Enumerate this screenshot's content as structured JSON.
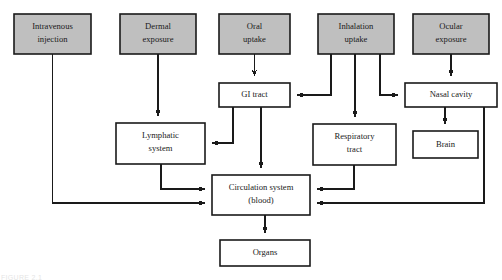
{
  "figure": {
    "caption_fragment": "FIGURE 2.1",
    "colors": {
      "source_box_fill": "#bfbfbf",
      "target_box_fill": "#ffffff",
      "stroke": "#1a1a1a",
      "background": "#ffffff"
    }
  },
  "nodes": {
    "intravenous_injection": {
      "label_line1": "Intravenous",
      "label_line2": "injection",
      "type": "exposure-route",
      "fill": "#bfbfbf",
      "x": 14,
      "y": 14,
      "w": 77,
      "h": 40
    },
    "dermal_exposure": {
      "label_line1": "Dermal",
      "label_line2": "exposure",
      "type": "exposure-route",
      "fill": "#bfbfbf",
      "x": 120,
      "y": 14,
      "w": 76,
      "h": 40
    },
    "oral_uptake": {
      "label_line1": "Oral",
      "label_line2": "uptake",
      "type": "exposure-route",
      "fill": "#bfbfbf",
      "x": 219,
      "y": 14,
      "w": 71,
      "h": 40
    },
    "inhalation_uptake": {
      "label_line1": "Inhalation",
      "label_line2": "uptake",
      "type": "exposure-route",
      "fill": "#bfbfbf",
      "x": 318,
      "y": 14,
      "w": 76,
      "h": 40
    },
    "ocular_exposure": {
      "label_line1": "Ocular",
      "label_line2": "exposure",
      "type": "exposure-route",
      "fill": "#bfbfbf",
      "x": 413,
      "y": 14,
      "w": 76,
      "h": 40
    },
    "gi_tract": {
      "label_line1": "GI tract",
      "label_line2": "",
      "type": "organ-system",
      "fill": "#ffffff",
      "x": 219,
      "y": 83,
      "w": 71,
      "h": 24
    },
    "nasal_cavity": {
      "label_line1": "Nasal cavity",
      "label_line2": "",
      "type": "organ-system",
      "fill": "#ffffff",
      "x": 405,
      "y": 83,
      "w": 92,
      "h": 24
    },
    "lymphatic_system": {
      "label_line1": "Lymphatic",
      "label_line2": "system",
      "type": "organ-system",
      "fill": "#ffffff",
      "x": 116,
      "y": 123,
      "w": 89,
      "h": 41
    },
    "respiratory_tract": {
      "label_line1": "Respiratory",
      "label_line2": "tract",
      "type": "organ-system",
      "fill": "#ffffff",
      "x": 313,
      "y": 124,
      "w": 83,
      "h": 41
    },
    "brain": {
      "label_line1": "Brain",
      "label_line2": "",
      "type": "organ-system",
      "fill": "#ffffff",
      "x": 413,
      "y": 131,
      "w": 65,
      "h": 27
    },
    "circulation_system": {
      "label_line1": "Circulation system",
      "label_line2": "(blood)",
      "type": "organ-system",
      "fill": "#ffffff",
      "x": 212,
      "y": 175,
      "w": 98,
      "h": 40
    },
    "organs": {
      "label_line1": "Organs",
      "label_line2": "",
      "type": "organ-system",
      "fill": "#ffffff",
      "x": 220,
      "y": 240,
      "w": 90,
      "h": 26
    }
  },
  "edges": [
    {
      "from": "intravenous_injection",
      "to": "circulation_system",
      "style": "orthogonal-left"
    },
    {
      "from": "dermal_exposure",
      "to": "lymphatic_system",
      "style": "straight-down"
    },
    {
      "from": "oral_uptake",
      "to": "gi_tract",
      "style": "straight-down"
    },
    {
      "from": "inhalation_uptake",
      "to": "gi_tract",
      "style": "orthogonal-left"
    },
    {
      "from": "inhalation_uptake",
      "to": "respiratory_tract",
      "style": "straight-down"
    },
    {
      "from": "inhalation_uptake",
      "to": "nasal_cavity",
      "style": "orthogonal-right"
    },
    {
      "from": "ocular_exposure",
      "to": "nasal_cavity",
      "style": "straight-down"
    },
    {
      "from": "gi_tract",
      "to": "lymphatic_system",
      "style": "orthogonal-left"
    },
    {
      "from": "gi_tract",
      "to": "circulation_system",
      "style": "straight-down"
    },
    {
      "from": "lymphatic_system",
      "to": "circulation_system",
      "style": "orthogonal-right"
    },
    {
      "from": "respiratory_tract",
      "to": "circulation_system",
      "style": "orthogonal-left"
    },
    {
      "from": "nasal_cavity",
      "to": "brain",
      "style": "straight-down"
    },
    {
      "from": "nasal_cavity",
      "to": "circulation_system",
      "style": "orthogonal-left"
    },
    {
      "from": "circulation_system",
      "to": "organs",
      "style": "straight-down"
    }
  ]
}
